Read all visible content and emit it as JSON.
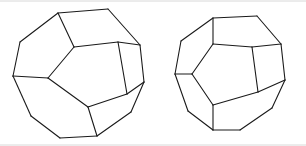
{
  "canvas": {
    "width": 306,
    "height": 146,
    "background": "#ffffff",
    "stroke_color": "#1a1a1a",
    "stroke_width": 1.1,
    "frame_color": "#d8d8d8",
    "description": "Two line-drawn regular dodecahedra shown in slightly different orientations on a plain white background"
  },
  "frame": {
    "top_rule": {
      "x1": 0,
      "y1": 1,
      "x2": 306,
      "y2": 1
    },
    "bottom_rule": {
      "x1": 0,
      "y1": 145,
      "x2": 306,
      "y2": 145
    }
  },
  "figures": [
    {
      "name": "dodecahedron-left",
      "label": "left-dodecahedron",
      "center_x": 78,
      "center_y": 74,
      "radius": 66,
      "orientation": "front pentagon face tilted, apex toward upper-left",
      "vertex_count": 20,
      "face_count": 12,
      "vertices": {
        "o1": [
          58,
          13
        ],
        "o2": [
          108,
          9
        ],
        "o3": [
          140,
          45
        ],
        "o4": [
          144,
          82
        ],
        "o5": [
          131,
          112
        ],
        "o6": [
          97,
          136
        ],
        "o7": [
          60,
          138
        ],
        "o8": [
          31,
          116
        ],
        "o9": [
          13,
          76
        ],
        "o10": [
          20,
          42
        ],
        "i1": [
          74,
          47
        ],
        "i2": [
          118,
          42
        ],
        "i3": [
          127,
          94
        ],
        "i4": [
          88,
          107
        ],
        "i5": [
          48,
          78
        ]
      },
      "edges": [
        [
          "o1",
          "o2"
        ],
        [
          "o2",
          "o3"
        ],
        [
          "o3",
          "o4"
        ],
        [
          "o4",
          "o5"
        ],
        [
          "o5",
          "o6"
        ],
        [
          "o6",
          "o7"
        ],
        [
          "o7",
          "o8"
        ],
        [
          "o8",
          "o9"
        ],
        [
          "o9",
          "o10"
        ],
        [
          "o10",
          "o1"
        ],
        [
          "i1",
          "i2"
        ],
        [
          "i2",
          "i3"
        ],
        [
          "i3",
          "i4"
        ],
        [
          "i4",
          "i5"
        ],
        [
          "i5",
          "i1"
        ],
        [
          "o1",
          "i1"
        ],
        [
          "o3",
          "i2"
        ],
        [
          "o4",
          "i3"
        ],
        [
          "o6",
          "i4"
        ],
        [
          "o9",
          "i5"
        ]
      ]
    },
    {
      "name": "dodecahedron-right",
      "label": "right-dodecahedron",
      "center_x": 228,
      "center_y": 73,
      "radius": 55,
      "orientation": "front pentagon face upright, vertical edge at top and bottom",
      "vertex_count": 20,
      "face_count": 12,
      "vertices": {
        "o1": [
          213,
          18
        ],
        "o2": [
          257,
          16
        ],
        "o3": [
          281,
          44
        ],
        "o4": [
          285,
          80
        ],
        "o5": [
          272,
          108
        ],
        "o6": [
          240,
          130
        ],
        "o7": [
          213,
          130
        ],
        "o8": [
          188,
          111
        ],
        "o9": [
          175,
          74
        ],
        "o10": [
          181,
          41
        ],
        "i1": [
          213,
          44
        ],
        "i2": [
          252,
          47
        ],
        "i3": [
          258,
          92
        ],
        "i4": [
          213,
          105
        ],
        "i5": [
          192,
          74
        ]
      },
      "edges": [
        [
          "o1",
          "o2"
        ],
        [
          "o2",
          "o3"
        ],
        [
          "o3",
          "o4"
        ],
        [
          "o4",
          "o5"
        ],
        [
          "o5",
          "o6"
        ],
        [
          "o6",
          "o7"
        ],
        [
          "o7",
          "o8"
        ],
        [
          "o8",
          "o9"
        ],
        [
          "o9",
          "o10"
        ],
        [
          "o10",
          "o1"
        ],
        [
          "i1",
          "i2"
        ],
        [
          "i2",
          "i3"
        ],
        [
          "i3",
          "i4"
        ],
        [
          "i4",
          "i5"
        ],
        [
          "i5",
          "i1"
        ],
        [
          "o1",
          "i1"
        ],
        [
          "o3",
          "i2"
        ],
        [
          "o4",
          "i3"
        ],
        [
          "o7",
          "i4"
        ],
        [
          "o9",
          "i5"
        ]
      ]
    }
  ]
}
